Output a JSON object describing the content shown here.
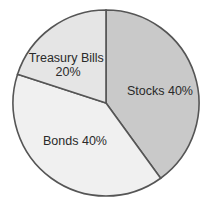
{
  "chart_data": {
    "type": "pie",
    "title": "",
    "start": "top",
    "direction": "clockwise",
    "slices": [
      {
        "label": "Stocks",
        "value": 40,
        "display": "Stocks 40%",
        "color": "#c9c9c9"
      },
      {
        "label": "Bonds",
        "value": 40,
        "display": "Bonds 40%",
        "color": "#f0f0f0"
      },
      {
        "label": "Treasury Bills",
        "value": 20,
        "display_lines": [
          "Treasury Bills",
          "20%"
        ],
        "color": "#e5e5e5"
      }
    ],
    "outline_color": "#555555",
    "legend": "none"
  }
}
